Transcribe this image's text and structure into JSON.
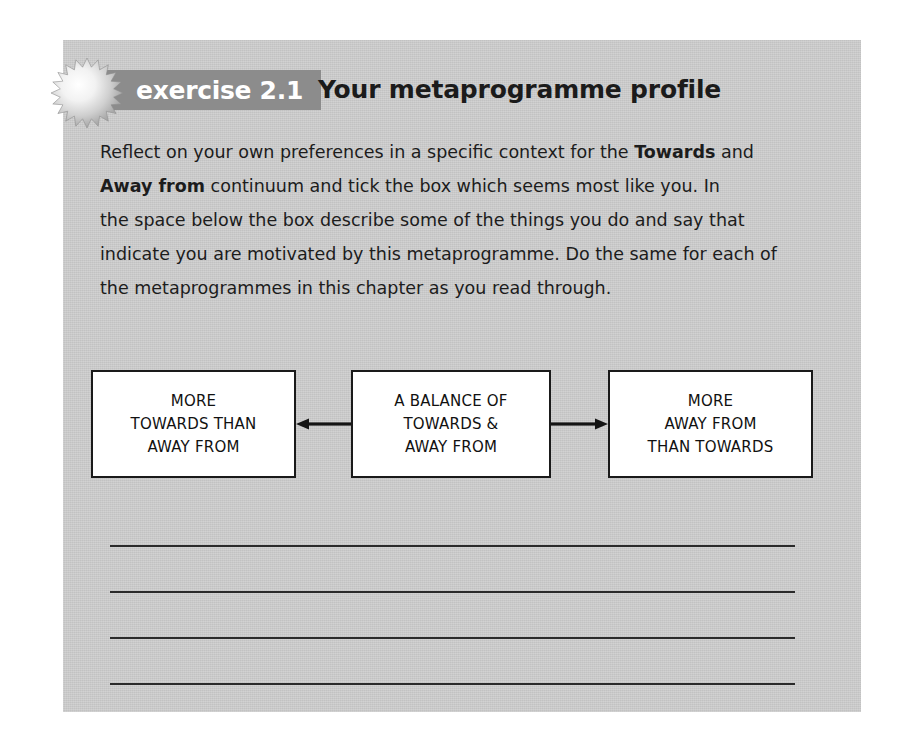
{
  "exercise": {
    "badge_label": "exercise 2.1",
    "title": "Your metaprogramme profile",
    "starburst_icon": "starburst-icon",
    "intro_paragraph": {
      "lines": [
        {
          "segments": [
            {
              "text": "Reflect on your own preferences in a specific context for the ",
              "bold": false
            },
            {
              "text": "Towards",
              "bold": true
            },
            {
              "text": " and",
              "bold": false
            }
          ]
        },
        {
          "segments": [
            {
              "text": "Away from",
              "bold": true
            },
            {
              "text": " continuum and tick the box which seems most like you. In",
              "bold": false
            }
          ]
        },
        {
          "segments": [
            {
              "text": "the space below the box describe some of the things you do and say that",
              "bold": false
            }
          ]
        },
        {
          "segments": [
            {
              "text": "indicate you are motivated by this metaprogramme. Do the same for each of",
              "bold": false
            }
          ]
        },
        {
          "segments": [
            {
              "text": "the metaprogrammes in this chapter as you read through.",
              "bold": false
            }
          ]
        }
      ],
      "full_text": "Reflect on your own preferences in a specific context for the Towards and Away from continuum and tick the box which seems most like you. In the space below the box describe some of the things you do and say that indicate you are motivated by this metaprogramme. Do the same for each of the metaprogrammes in this chapter as you read through."
    }
  },
  "diagram": {
    "type": "continuum-three-boxes",
    "boxes": [
      {
        "id": "more-towards",
        "lines": [
          "MORE",
          "TOWARDS THAN",
          "AWAY FROM"
        ]
      },
      {
        "id": "balance",
        "lines": [
          "A BALANCE OF",
          "TOWARDS &",
          "AWAY FROM"
        ]
      },
      {
        "id": "more-away-from",
        "lines": [
          "MORE",
          "AWAY FROM",
          "THAN TOWARDS"
        ]
      }
    ],
    "connectors": [
      {
        "id": "arrow-to-left",
        "direction": "left",
        "icon": "arrow-left-icon"
      },
      {
        "id": "arrow-to-right",
        "direction": "right",
        "icon": "arrow-right-icon"
      }
    ]
  },
  "answer_area": {
    "line_count": 4,
    "lines": [
      "",
      "",
      "",
      ""
    ]
  },
  "colors": {
    "panel_background": "#c9c9c9",
    "badge_background": "#8c8c8c",
    "badge_text": "#ffffff",
    "body_text": "#1c1c1c",
    "box_border": "#1a1a1a",
    "box_fill": "#ffffff",
    "rule_line": "#2a2a2a",
    "page_background": "#ffffff"
  }
}
